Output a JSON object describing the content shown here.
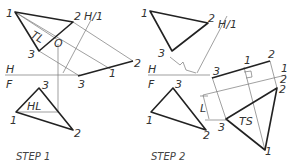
{
  "steps": [
    {
      "caption": "STEP 1",
      "labels": {
        "p1_top": "1",
        "p2_top": "2",
        "p3_top": "3",
        "fold_h1": "H/1",
        "tl": "TL",
        "o": "O",
        "h": "H",
        "f": "F",
        "p3_edge": "3",
        "p1_edge": "1",
        "p2_edge": "2",
        "p3_front": "3",
        "p1_front": "1",
        "p2_front": "2",
        "hl": "HL"
      }
    },
    {
      "caption": "STEP 2",
      "labels": {
        "p1_top": "1",
        "p2_top": "2",
        "p3_top": "3",
        "fold_h1": "H/1",
        "h": "H",
        "f": "F",
        "p3_edge": "3",
        "p1_edge": "1",
        "p2_edge": "2",
        "fold_12_1": "1",
        "fold_12_2": "2",
        "p3_front": "3",
        "p1_front": "1",
        "p2_front": "2",
        "l": "L",
        "p3_ts": "3",
        "p2_ts": "2",
        "p1_ts": "1",
        "ts": "TS"
      }
    }
  ]
}
